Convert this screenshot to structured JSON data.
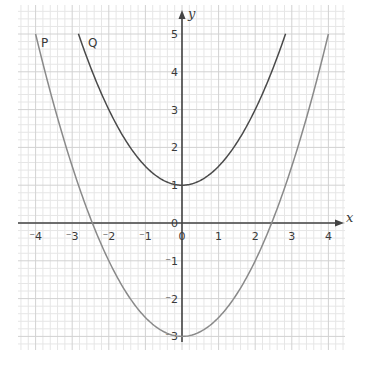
{
  "chart_data": {
    "type": "line",
    "title": "",
    "xlabel": "x",
    "ylabel": "y",
    "xlim": [
      -4.4,
      4.5
    ],
    "ylim": [
      -3.4,
      5.8
    ],
    "grid": true,
    "grid_minor_step": 0.2,
    "x_ticks": [
      -4,
      -3,
      -2,
      -1,
      0,
      1,
      2,
      3,
      4
    ],
    "x_tick_labels": [
      "⁻4",
      "⁻3",
      "⁻2",
      "⁻1",
      "0",
      "1",
      "2",
      "3",
      "4"
    ],
    "y_ticks": [
      -3,
      -2,
      -1,
      0,
      1,
      2,
      3,
      4,
      5
    ],
    "y_tick_labels": [
      "⁻3",
      "⁻2",
      "⁻1",
      "0",
      "1",
      "2",
      "3",
      "4",
      "5"
    ],
    "series": [
      {
        "name": "P",
        "equation": "y = 0.5x^2 - 3",
        "color": "#8a8a8a",
        "x": [
          -4.0,
          -3.0,
          -2.45,
          -2.0,
          -1.0,
          0,
          1.0,
          2.0,
          2.45,
          3.0,
          4.0
        ],
        "y": [
          5.0,
          1.5,
          0.0,
          -1.0,
          -2.5,
          -3.0,
          -2.5,
          -1.0,
          0.0,
          1.5,
          5.0
        ]
      },
      {
        "name": "Q",
        "equation": "y = 0.5x^2 + 1",
        "color": "#4a4a4a",
        "x": [
          -2.83,
          -2.0,
          -1.0,
          0,
          1.0,
          2.0,
          2.83
        ],
        "y": [
          5.0,
          3.0,
          1.5,
          1.0,
          1.5,
          3.0,
          5.0
        ]
      }
    ],
    "annotations": [
      {
        "text": "P",
        "x": -3.8,
        "y": 4.8
      },
      {
        "text": "Q",
        "x": -2.5,
        "y": 4.8
      }
    ]
  },
  "labels": {
    "x_axis": "x",
    "y_axis": "y",
    "curve_p": "P",
    "curve_q": "Q"
  },
  "colors": {
    "grid_minor": "#e6e6e6",
    "grid_major": "#d2d2d2",
    "axis": "#444444",
    "curve_p": "#8a8a8a",
    "curve_q": "#4a4a4a"
  }
}
